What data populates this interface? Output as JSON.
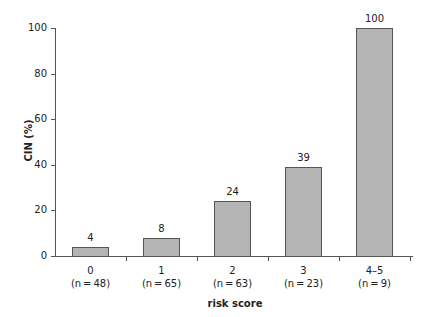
{
  "chart_data": {
    "type": "bar",
    "title": "",
    "xlabel": "risk score",
    "ylabel": "CIN (%)",
    "ylim": [
      0,
      100
    ],
    "yticks": [
      0,
      20,
      40,
      60,
      80,
      100
    ],
    "grid": false,
    "categories": [
      "0",
      "1",
      "2",
      "3",
      "4–5"
    ],
    "category_n": [
      "(n = 48)",
      "(n = 65)",
      "(n = 63)",
      "(n = 23)",
      "(n = 9)"
    ],
    "values": [
      4,
      8,
      24,
      39,
      100
    ],
    "value_labels": [
      "4",
      "8",
      "24",
      "39",
      "100"
    ],
    "colors": {
      "bar_fill": "#b4b4b4",
      "bar_edge": "#555555",
      "axis": "#555555"
    }
  }
}
